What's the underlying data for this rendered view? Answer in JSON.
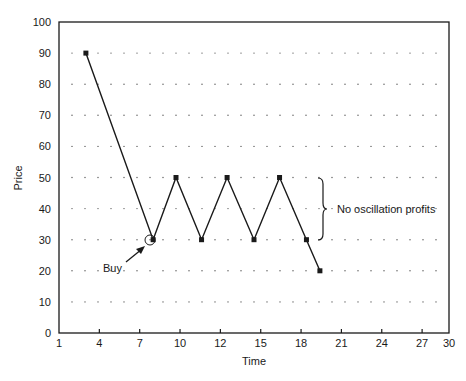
{
  "chart_data": {
    "type": "line",
    "title": "",
    "xlabel": "Time",
    "ylabel": "Price",
    "xlim": [
      1,
      30
    ],
    "ylim": [
      0,
      100
    ],
    "x_ticks": [
      1,
      4,
      7,
      10,
      12,
      15,
      18,
      21,
      24,
      27,
      30
    ],
    "x_tick_positions": [
      1,
      4,
      7,
      10,
      13,
      16,
      19,
      22,
      25,
      28,
      30
    ],
    "y_ticks": [
      0,
      10,
      20,
      30,
      40,
      50,
      60,
      70,
      80,
      90,
      100
    ],
    "grid": "dotted horizontal at each y tick",
    "legend": null,
    "series": [
      {
        "name": "Price",
        "x": [
          3,
          8,
          9.7,
          11.6,
          13.5,
          15.5,
          17.4,
          19.4,
          20.4
        ],
        "y": [
          90,
          30,
          50,
          30,
          50,
          30,
          50,
          30,
          20
        ],
        "marker": "square"
      }
    ],
    "annotations": [
      {
        "text": "Buy",
        "points_to": {
          "x": 8,
          "y": 30
        },
        "style": "arrow + circled point"
      },
      {
        "text": "No oscillation profits",
        "spans_y": [
          30,
          50
        ],
        "at_x": 20.5,
        "style": "curly brace"
      }
    ]
  },
  "labels": {
    "xlabel": "Time",
    "ylabel": "Price",
    "buy": "Buy",
    "no_osc": "No oscillation profits"
  },
  "colors": {
    "line": "#1a1a1a",
    "frame": "#1a1a1a",
    "grid_dots": "#555555",
    "background": "#ffffff"
  }
}
